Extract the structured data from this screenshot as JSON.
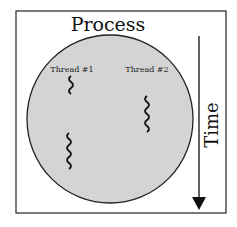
{
  "diagram": {
    "title": "Process",
    "axis_label": "Time",
    "threads": [
      {
        "label": "Thread #1"
      },
      {
        "label": "Thread #2"
      }
    ],
    "colors": {
      "process_fill": "#d4d4d4",
      "stroke": "#111111",
      "background": "#ffffff"
    }
  }
}
